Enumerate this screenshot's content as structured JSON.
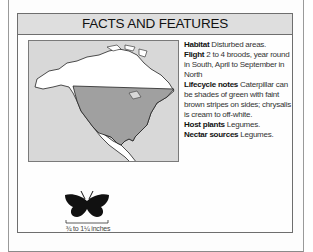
{
  "header": {
    "title": "FACTS AND FEATURES"
  },
  "map": {
    "icon": "north-america-range-map",
    "range_color": "#a0a0a0",
    "land_color": "#ffffff",
    "sea_color": "#d8d8d8"
  },
  "facts": [
    {
      "label": "Habitat",
      "text": "Disturbed areas."
    },
    {
      "label": "Flight",
      "text": "2 to 4 broods, year round in South, April to September in North"
    },
    {
      "label": "Lifecycle notes",
      "text": "Caterpillar can be shades of green with faint brown stripes on sides; chrysalis is cream to off-white."
    },
    {
      "label": "Host plants",
      "text": "Legumes."
    },
    {
      "label": "Nectar sources",
      "text": "Legumes."
    }
  ],
  "size": {
    "icon": "butterfly-silhouette-icon",
    "label": "¾ to 1¼ inches"
  }
}
